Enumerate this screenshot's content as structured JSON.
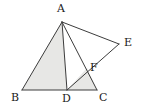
{
  "figure": {
    "kind": "geometry-diagram",
    "width": 142,
    "height": 110,
    "background_color": "#ffffff",
    "stroke_color": "#3c3c3c",
    "shade_color": "#e7e7e5",
    "label_color": "#1a1a1a"
  },
  "points": {
    "A": {
      "label": "A",
      "x": 62,
      "y": 22,
      "label_x": 57,
      "label_y": 3
    },
    "B": {
      "label": "B",
      "x": 22,
      "y": 90,
      "label_x": 11,
      "label_y": 92
    },
    "C": {
      "label": "C",
      "x": 97,
      "y": 90,
      "label_x": 99,
      "label_y": 92
    },
    "D": {
      "label": "D",
      "x": 67,
      "y": 90,
      "label_x": 62,
      "label_y": 93
    },
    "E": {
      "label": "E",
      "x": 119,
      "y": 44,
      "label_x": 124,
      "label_y": 37
    },
    "F": {
      "label": "F",
      "x": 87,
      "y": 68,
      "label_x": 90,
      "label_y": 62
    }
  },
  "segments": [
    {
      "name": "segment-AB",
      "from": "A",
      "to": "B"
    },
    {
      "name": "segment-BC",
      "from": "B",
      "to": "C"
    },
    {
      "name": "segment-AD",
      "from": "A",
      "to": "D"
    },
    {
      "name": "segment-AC",
      "from": "A",
      "to": "C"
    },
    {
      "name": "segment-AE",
      "from": "A",
      "to": "E"
    },
    {
      "name": "segment-DE",
      "from": "D",
      "to": "E"
    }
  ],
  "shaded_regions": [
    {
      "name": "region-ABD",
      "vertices": [
        "A",
        "B",
        "D"
      ]
    },
    {
      "name": "region-DFC",
      "vertices": [
        "D",
        "F",
        "C"
      ]
    }
  ]
}
